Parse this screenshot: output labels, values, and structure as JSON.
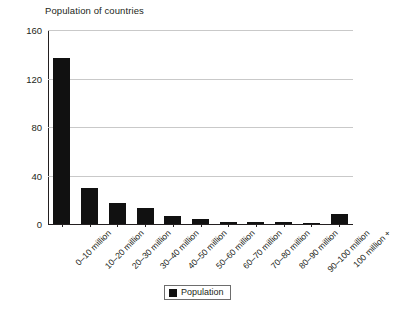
{
  "chart_data": {
    "type": "bar",
    "title": "Population of countries",
    "xlabel": "",
    "ylabel": "",
    "categories": [
      "0–10 million",
      "10–20 million",
      "20–30 million",
      "30–40 million",
      "40–50 million",
      "50–60 million",
      "60–70 million",
      "70–80 million",
      "80–90 million",
      "90–100 million",
      "100 million +"
    ],
    "series": [
      {
        "name": "Population",
        "values": [
          137,
          30,
          17,
          13,
          7,
          4,
          2,
          2,
          2,
          1,
          8
        ]
      }
    ],
    "ylim": [
      0,
      160
    ],
    "yticks": [
      0,
      40,
      80,
      120,
      160
    ],
    "ytick_labels": [
      "0",
      "40",
      "80",
      "120",
      "160"
    ],
    "grid": true,
    "legend": {
      "position": "bottom-center",
      "entries": [
        {
          "label": "Population",
          "color": "#111111",
          "swatch": "legend-swatch-square"
        }
      ]
    },
    "colors": {
      "bar": "#111111",
      "gridline": "#c9c9c9",
      "axis": "#231f20",
      "background": "#ffffff",
      "text": "#231f20"
    }
  }
}
